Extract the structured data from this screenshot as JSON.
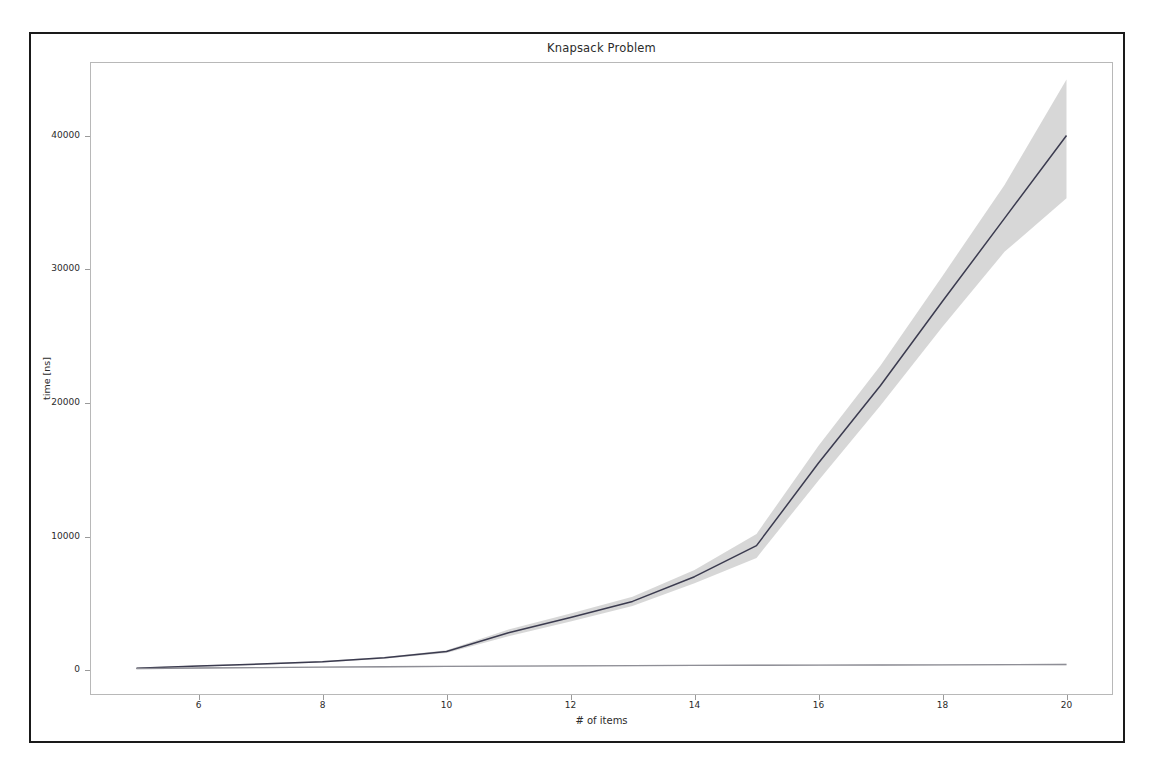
{
  "figure": {
    "title": "Knapsack Problem",
    "background_color": "#ffffff",
    "border_color": "#1a1a1a",
    "axes_frame_color": "#b8b8b8"
  },
  "chart_data": {
    "type": "line",
    "title": "Knapsack Problem",
    "xlabel": "# of items",
    "ylabel": "time [ns]",
    "xlim": [
      4.25,
      20.75
    ],
    "ylim": [
      -1850,
      45500
    ],
    "grid": false,
    "legend": "none",
    "xticks": [
      6,
      8,
      10,
      12,
      14,
      16,
      18,
      20
    ],
    "yticks": [
      0,
      10000,
      20000,
      30000,
      40000
    ],
    "x": [
      5,
      6,
      7,
      8,
      9,
      10,
      11,
      12,
      13,
      14,
      15,
      16,
      17,
      18,
      19,
      20
    ],
    "series": [
      {
        "name": "exhaustive-search",
        "color": "#3b3b4f",
        "band_color": "#c9c9c9",
        "values": [
          160,
          310,
          470,
          640,
          930,
          1400,
          2800,
          3950,
          5150,
          7000,
          9320,
          15500,
          21300,
          27600,
          33800,
          40000
        ],
        "band_lower": [
          120,
          260,
          420,
          580,
          860,
          1300,
          2550,
          3650,
          4800,
          6500,
          8400,
          14200,
          19800,
          25700,
          31300,
          35300
        ],
        "band_upper": [
          200,
          360,
          520,
          700,
          1000,
          1500,
          3050,
          4250,
          5500,
          7500,
          10200,
          16800,
          22800,
          29500,
          36300,
          44200
        ]
      },
      {
        "name": "dynamic-programming",
        "color": "#8e8e96",
        "band_color": "#d6d6d6",
        "values": [
          120,
          170,
          200,
          230,
          265,
          290,
          315,
          330,
          345,
          360,
          375,
          385,
          395,
          405,
          415,
          430
        ],
        "band_lower": [
          70,
          120,
          150,
          180,
          215,
          240,
          265,
          280,
          295,
          310,
          325,
          335,
          345,
          355,
          365,
          375
        ],
        "band_upper": [
          170,
          220,
          250,
          280,
          315,
          340,
          365,
          380,
          395,
          410,
          425,
          435,
          445,
          455,
          465,
          490
        ]
      }
    ]
  }
}
